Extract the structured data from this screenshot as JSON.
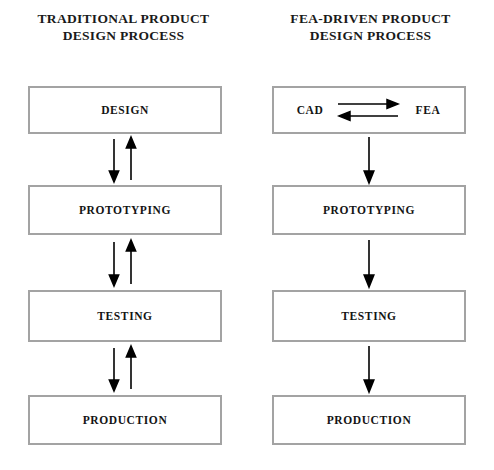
{
  "diagram": {
    "background_color": "#ffffff",
    "box_border_color": "#a3a3a3",
    "arrow_color": "#000000",
    "text_color": "#141414"
  },
  "columns": [
    {
      "id": "traditional",
      "title": "TRADITIONAL PRODUCT\nDESIGN PROCESS",
      "title_line1": "TRADITIONAL PRODUCT",
      "title_line2": "DESIGN PROCESS",
      "flow_type": "bidirectional",
      "stages": [
        {
          "label": "DESIGN"
        },
        {
          "label": "PROTOTYPING"
        },
        {
          "label": "TESTING"
        },
        {
          "label": "PRODUCTION"
        }
      ],
      "connectors": [
        {
          "from": "DESIGN",
          "to": "PROTOTYPING",
          "direction": "bidirectional",
          "arrows": [
            "down",
            "up"
          ]
        },
        {
          "from": "PROTOTYPING",
          "to": "TESTING",
          "direction": "bidirectional",
          "arrows": [
            "down",
            "up"
          ]
        },
        {
          "from": "TESTING",
          "to": "PRODUCTION",
          "direction": "bidirectional",
          "arrows": [
            "down",
            "up"
          ]
        }
      ]
    },
    {
      "id": "fea-driven",
      "title": "FEA-DRIVEN PRODUCT\nDESIGN PROCESS",
      "title_line1": "FEA-DRIVEN PRODUCT",
      "title_line2": "DESIGN PROCESS",
      "flow_type": "unidirectional",
      "stages": [
        {
          "label": "CAD / FEA",
          "left_term": "CAD",
          "right_term": "FEA",
          "inner_arrows": [
            "right",
            "left"
          ]
        },
        {
          "label": "PROTOTYPING"
        },
        {
          "label": "TESTING"
        },
        {
          "label": "PRODUCTION"
        }
      ],
      "connectors": [
        {
          "from": "CAD / FEA",
          "to": "PROTOTYPING",
          "direction": "down",
          "arrows": [
            "down"
          ]
        },
        {
          "from": "PROTOTYPING",
          "to": "TESTING",
          "direction": "down",
          "arrows": [
            "down"
          ]
        },
        {
          "from": "TESTING",
          "to": "PRODUCTION",
          "direction": "down",
          "arrows": [
            "down"
          ]
        }
      ]
    }
  ]
}
